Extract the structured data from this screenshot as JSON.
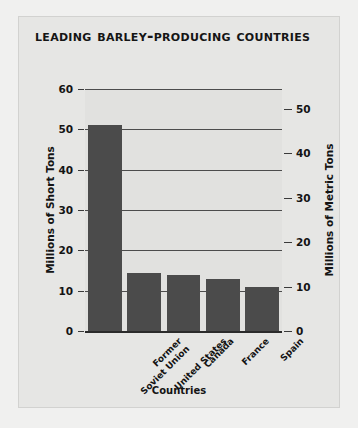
{
  "chart_data": {
    "type": "bar",
    "title": "Leading Barley-Producing Countries",
    "categories": [
      "Former Soviet Union",
      "United States",
      "Canada",
      "France",
      "Spain"
    ],
    "category_lines": [
      [
        "Former",
        "Soviet Union"
      ],
      [
        "United States"
      ],
      [
        "Canada"
      ],
      [
        "France"
      ],
      [
        "Spain"
      ]
    ],
    "values": [
      51,
      14.3,
      14,
      13,
      11
    ],
    "xlabel": "Countries",
    "ylabel": "Millions of Short Tons",
    "ylabel_secondary": "Millions of Metric Tons",
    "ylim": [
      0,
      60
    ],
    "yticks": [
      0,
      10,
      20,
      30,
      40,
      50,
      60
    ],
    "ylim_secondary": [
      0,
      54.43
    ],
    "yticks_secondary": [
      0,
      10,
      20,
      30,
      40,
      50
    ],
    "grid": true,
    "legend": "none",
    "bar_color": "#4b4b4b",
    "plot_background": "#e1e1df",
    "panel_background": "#e6e6e4",
    "page_background": "#f0f0ef",
    "grid_color": "#4c4c4c",
    "text_color": "#141414"
  }
}
